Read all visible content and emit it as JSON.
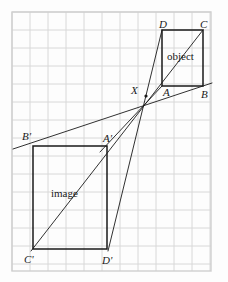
{
  "figure": {
    "type": "geometric-construction",
    "canvas": {
      "width": 228,
      "height": 282,
      "background": "#fdfdfd"
    },
    "grid": {
      "visible": true,
      "x": 12,
      "y": 12,
      "width": 199,
      "height": 259,
      "spacing": 18,
      "line_color": "#d8d8d8",
      "border_color": "#cfcfcf"
    },
    "stroke_color": "#1a1a1a",
    "centre": {
      "name": "X",
      "x": 146,
      "y": 96,
      "label_x": 131,
      "label_y": 91
    },
    "object": {
      "caption": "object",
      "caption_x": 185,
      "caption_y": 57,
      "corners": [
        {
          "name": "A",
          "x": 162,
          "y": 86,
          "label_x": 163,
          "label_y": 93
        },
        {
          "name": "B",
          "x": 203,
          "y": 86,
          "label_x": 201,
          "label_y": 95
        },
        {
          "name": "C",
          "x": 203,
          "y": 30,
          "label_x": 200,
          "label_y": 25
        },
        {
          "name": "D",
          "x": 162,
          "y": 30,
          "label_x": 159,
          "label_y": 25
        }
      ]
    },
    "image": {
      "caption": "image",
      "caption_x": 68,
      "caption_y": 194,
      "corners": [
        {
          "name": "A'",
          "x": 107,
          "y": 146,
          "label_x": 103,
          "label_y": 139
        },
        {
          "name": "B'",
          "x": 33,
          "y": 146,
          "label_x": 22,
          "label_y": 137
        },
        {
          "name": "C'",
          "x": 33,
          "y": 249,
          "label_x": 24,
          "label_y": 260
        },
        {
          "name": "D'",
          "x": 107,
          "y": 249,
          "label_x": 102,
          "label_y": 261
        }
      ]
    },
    "rays": [
      {
        "name": "ray-B-X-Bprime",
        "from": [
          212,
          83
        ],
        "to": [
          13,
          149
        ]
      },
      {
        "name": "ray-A-X-Aprime",
        "from": [
          162,
          86
        ],
        "to": [
          100,
          152
        ]
      },
      {
        "name": "ray-C-X-Cprime",
        "from": [
          203,
          30
        ],
        "to": [
          31,
          251
        ]
      },
      {
        "name": "ray-D-X-Dprime",
        "from": [
          162,
          30
        ],
        "to": [
          108,
          251
        ]
      }
    ]
  }
}
